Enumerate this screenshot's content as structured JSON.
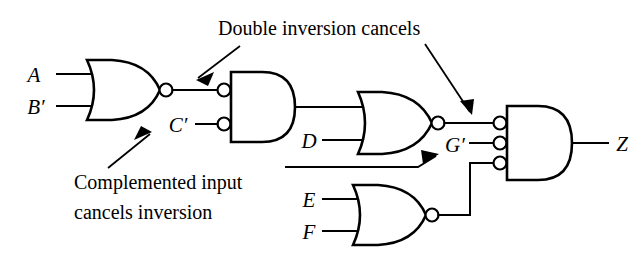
{
  "diagram": {
    "output_signal": "Z"
  },
  "colors": {
    "line": "#000000",
    "background": "#ffffff",
    "gate_fill": "#ffffff"
  },
  "signals": {
    "a": "A",
    "b_prime": "B′",
    "c_prime": "C′",
    "d": "D",
    "e": "E",
    "f": "F",
    "g_prime": "G′",
    "z": "Z"
  },
  "annotations": {
    "double_inversion": "Double inversion cancels",
    "complemented_line1": "Complemented input",
    "complemented_line2": "cancels inversion"
  },
  "gates": [
    {
      "id": "nor-ab",
      "type": "NOR",
      "inputs": [
        "A",
        "B′"
      ],
      "output": "to AND gate input 1"
    },
    {
      "id": "and-inv",
      "type": "AND with inverted inputs",
      "inputs": [
        "NOR output",
        "C′"
      ],
      "output": "to NOR gate input 1"
    },
    {
      "id": "nor-d",
      "type": "NOR",
      "inputs": [
        "AND output",
        "D"
      ],
      "output": "G′"
    },
    {
      "id": "nor-ef",
      "type": "NOR",
      "inputs": [
        "E",
        "F"
      ],
      "output": "to final AND input 3"
    },
    {
      "id": "and-final",
      "type": "AND with inverted inputs",
      "inputs": [
        "G′",
        "G′ branch",
        "NOR(E,F) output"
      ],
      "output": "Z"
    }
  ]
}
